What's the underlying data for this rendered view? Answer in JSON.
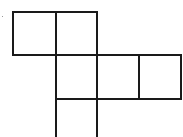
{
  "diagram": {
    "type": "cube-net",
    "stroke_color": "#1a1a1a",
    "background": "#ffffff",
    "faces": [
      {
        "id": "face-1",
        "row": 0,
        "col": 0
      },
      {
        "id": "face-2",
        "row": 0,
        "col": 1
      },
      {
        "id": "face-3",
        "row": 1,
        "col": 1
      },
      {
        "id": "face-4",
        "row": 1,
        "col": 2
      },
      {
        "id": "face-5",
        "row": 1,
        "col": 3
      },
      {
        "id": "face-6",
        "row": 2,
        "col": 1
      }
    ]
  }
}
